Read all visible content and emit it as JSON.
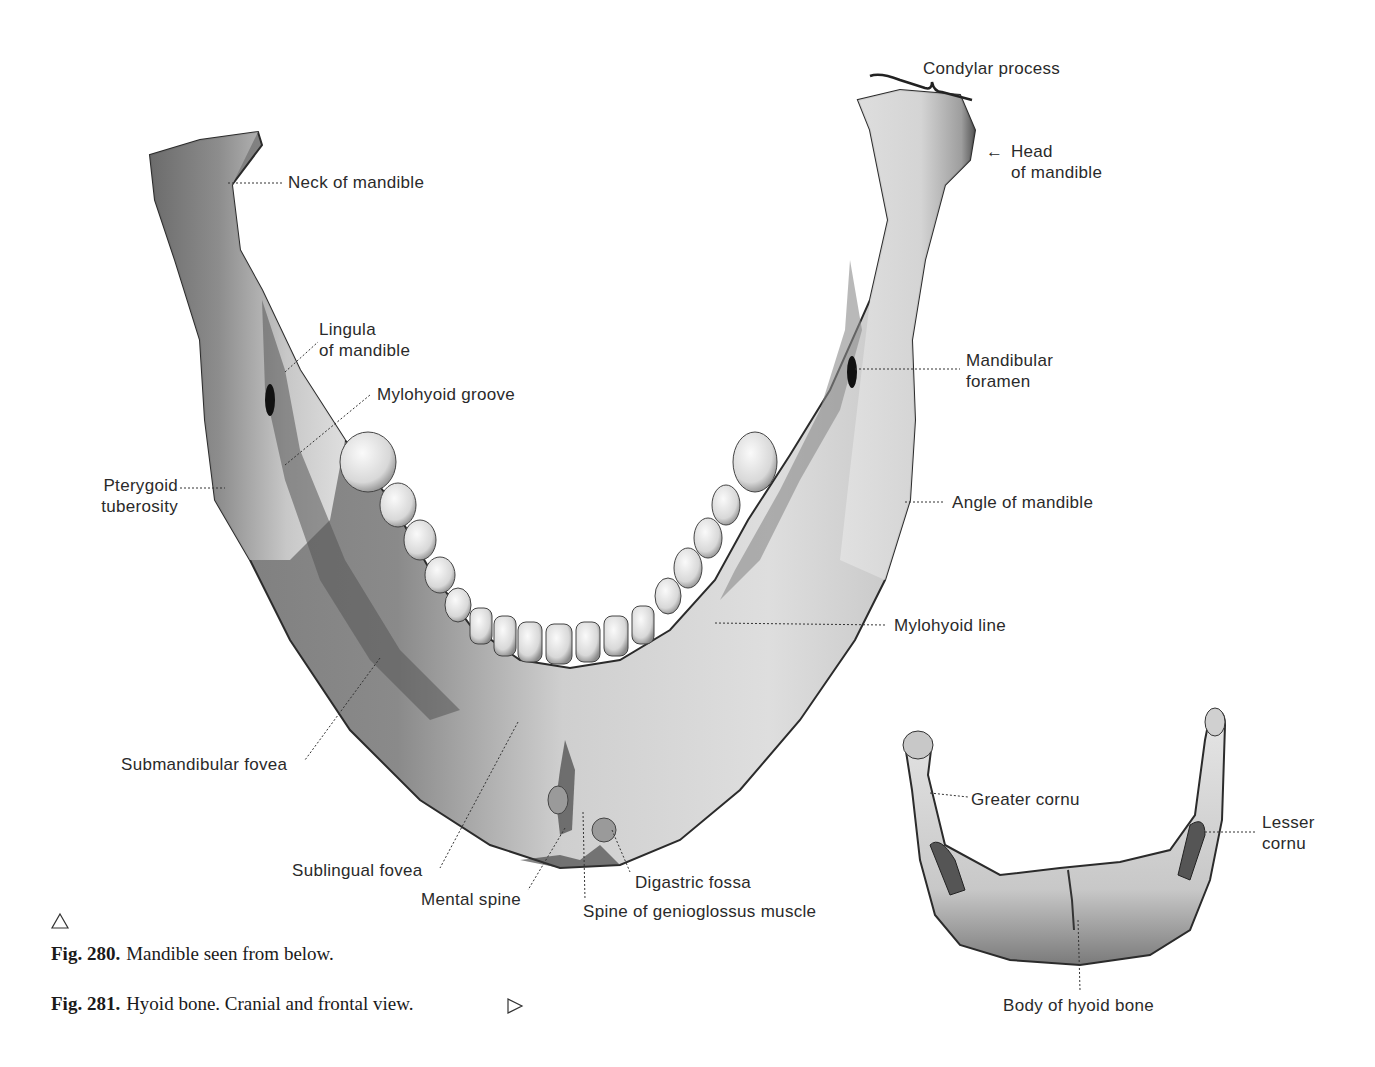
{
  "figure_280": {
    "number": "Fig. 280.",
    "caption": "Mandible seen from below.",
    "pointer_icon": "triangle-up-outline",
    "labels": {
      "condylar_process": "Condylar process",
      "head_of_mandible_1": "Head",
      "head_of_mandible_2": "of mandible",
      "neck_of_mandible": "Neck of mandible",
      "lingula_1": "Lingula",
      "lingula_2": "of mandible",
      "mylohyoid_groove": "Mylohyoid groove",
      "mandibular_foramen_1": "Mandibular",
      "mandibular_foramen_2": "foramen",
      "pterygoid_tuberosity_1": "Pterygoid",
      "pterygoid_tuberosity_2": "tuberosity",
      "angle_of_mandible": "Angle of mandible",
      "mylohyoid_line": "Mylohyoid line",
      "submandibular_fovea": "Submandibular fovea",
      "sublingual_fovea": "Sublingual fovea",
      "mental_spine": "Mental spine",
      "digastric_fossa": "Digastric fossa",
      "spine_of_genioglossus": "Spine of genioglossus muscle"
    },
    "arrow_glyph": "←"
  },
  "figure_281": {
    "number": "Fig. 281.",
    "caption": "Hyoid bone. Cranial and frontal view.",
    "pointer_icon": "triangle-right-outline",
    "labels": {
      "greater_cornu": "Greater cornu",
      "lesser_cornu_1": "Lesser",
      "lesser_cornu_2": "cornu",
      "body_of_hyoid": "Body of hyoid bone"
    }
  },
  "colors": {
    "bone_light": "#ededed",
    "bone_mid": "#bdbdbd",
    "bone_dark": "#5a5a5a",
    "outline": "#2b2b2b",
    "text": "#2a2a2a"
  }
}
